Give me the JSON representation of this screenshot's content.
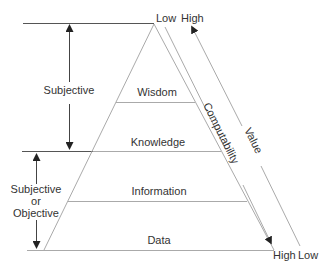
{
  "diagram": {
    "levels": [
      {
        "label": "Wisdom"
      },
      {
        "label": "Knowledge"
      },
      {
        "label": "Information"
      },
      {
        "label": "Data"
      }
    ],
    "left_annotations": {
      "upper": "Subjective",
      "lower_line1": "Subjective",
      "lower_line2": "or",
      "lower_line3": "Objective"
    },
    "axes": {
      "computability": {
        "label": "Computability",
        "top": "Low",
        "bottom": "High"
      },
      "value": {
        "label": "Value",
        "top": "High",
        "bottom": "Low"
      }
    },
    "colors": {
      "line": "#999999",
      "dark_line": "#444444",
      "text": "#333333"
    }
  }
}
